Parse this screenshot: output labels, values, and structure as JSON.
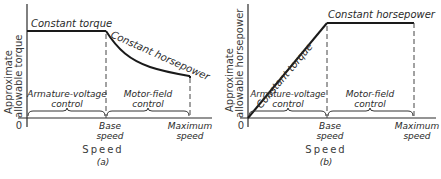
{
  "figures": [
    {
      "id": "a",
      "caption": "(a)",
      "y_axis_label_line1": "Approximate",
      "y_axis_label_line2": "allowable torque",
      "x_axis_label": "Speed",
      "origin_label": "0",
      "curve_labels": {
        "first": "Constant torque",
        "second": "Constant horsepower"
      },
      "regions": {
        "left_line1": "Armature-voltage",
        "left_line2": "control",
        "right_line1": "Motor-field",
        "right_line2": "control"
      },
      "ticks": {
        "base_line1": "Base",
        "base_line2": "speed",
        "max_line1": "Maximum",
        "max_line2": "speed"
      }
    },
    {
      "id": "b",
      "caption": "(b)",
      "y_axis_label_line1": "Approximate",
      "y_axis_label_line2": "allowable horsepower",
      "x_axis_label": "Speed",
      "origin_label": "0",
      "curve_labels": {
        "first": "Constant torque",
        "second": "Constant horsepower"
      },
      "regions": {
        "left_line1": "Armature-voltage",
        "left_line2": "control",
        "right_line1": "Motor-field",
        "right_line2": "control"
      },
      "ticks": {
        "base_line1": "Base",
        "base_line2": "speed",
        "max_line1": "Maximum",
        "max_line2": "speed"
      }
    }
  ],
  "colors": {
    "line": "#1a1a1a",
    "background": "#ffffff"
  }
}
